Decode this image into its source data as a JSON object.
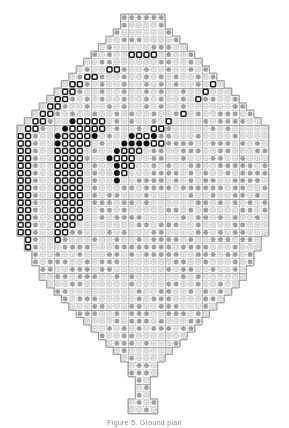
{
  "document": {
    "title": "Cross-Stitch Pattern Chart",
    "caption": "Figure 5.   Ground plan"
  },
  "palette": {
    "background": "#ffffff",
    "grid_minor": "#c9c9c9",
    "grid_major": "#8f8f8f",
    "outline": "#9a9a9a",
    "symbol_filled": "#111111",
    "symbol_open": "#1a1a1a",
    "symbol_cross": "#9e9e9e",
    "symbol_ring": "#cfcfcf"
  },
  "legend": [
    {
      "key": "filled",
      "glyph": "filled-circle",
      "name": "filled-circle-symbol"
    },
    {
      "key": "open",
      "glyph": "open-rounded-square",
      "name": "open-square-symbol"
    },
    {
      "key": "cross",
      "glyph": "plus-cross",
      "name": "cross-symbol"
    },
    {
      "key": "ring",
      "glyph": "light-ring",
      "name": "ring-symbol"
    }
  ],
  "chart_data": {
    "type": "heatmap",
    "xlabel": "",
    "ylabel": "",
    "grid": true,
    "cols": 34,
    "rows": 54,
    "cell_px": 7.4,
    "origin_px": [
      17,
      14
    ],
    "major_every": 5,
    "legend_position": "none",
    "symbol_codes": {
      "0": "empty",
      "1": "ring",
      "2": "cross",
      "3": "open",
      "4": "filled"
    },
    "row_extents": [
      [
        14,
        19
      ],
      [
        14,
        19
      ],
      [
        13,
        20
      ],
      [
        12,
        21
      ],
      [
        11,
        22
      ],
      [
        10,
        23
      ],
      [
        9,
        24
      ],
      [
        8,
        25
      ],
      [
        7,
        26
      ],
      [
        6,
        27
      ],
      [
        5,
        28
      ],
      [
        4,
        29
      ],
      [
        3,
        30
      ],
      [
        2,
        31
      ],
      [
        1,
        32
      ],
      [
        0,
        33
      ],
      [
        0,
        33
      ],
      [
        0,
        33
      ],
      [
        0,
        33
      ],
      [
        0,
        33
      ],
      [
        0,
        33
      ],
      [
        0,
        33
      ],
      [
        0,
        33
      ],
      [
        0,
        33
      ],
      [
        0,
        33
      ],
      [
        0,
        33
      ],
      [
        0,
        33
      ],
      [
        0,
        33
      ],
      [
        0,
        33
      ],
      [
        0,
        33
      ],
      [
        1,
        32
      ],
      [
        1,
        32
      ],
      [
        2,
        31
      ],
      [
        2,
        31
      ],
      [
        3,
        30
      ],
      [
        3,
        30
      ],
      [
        4,
        29
      ],
      [
        5,
        28
      ],
      [
        6,
        27
      ],
      [
        7,
        26
      ],
      [
        8,
        25
      ],
      [
        9,
        24
      ],
      [
        10,
        23
      ],
      [
        11,
        22
      ],
      [
        12,
        21
      ],
      [
        13,
        20
      ],
      [
        14,
        19
      ],
      [
        15,
        18
      ],
      [
        15,
        18
      ],
      [
        16,
        17
      ],
      [
        16,
        17
      ],
      [
        16,
        17
      ],
      [
        15,
        18
      ],
      [
        15,
        18
      ]
    ],
    "grid_rows": [
      "00000000000000222222000000000000000",
      "00000000000000211112000000000000000",
      "000000000000021111112000000000000",
      "000000000000112221111210000000000",
      "00000000000121111122211210000000",
      "0000000000212113333121121200000",
      "000000000112211111122112112000",
      "00000000121133211211211212100",
      "0000000123321121121212112121",
      "000000133212112112121211213",
      "00000133211211211212112113",
      "0000133212121121121211213",
      "000133211211212112121121",
      "00133212112112121121123",
      "0133211433331212112131",
      "1332114333331211213321",
      "33211433334121143342",
      "332114333312114444332",
      "3321133331211433312",
      "33211333321143331",
      "3321133331211433",
      "332113333121143",
      "33211333312114",
      "3321133331211",
      "332113333121",
      "33211333312",
      "3321133331",
      "332113333",
      "33211333",
      "3321133",
      "332113",
      "33211",
      "3321",
      "332",
      "33",
      "3"
    ]
  }
}
